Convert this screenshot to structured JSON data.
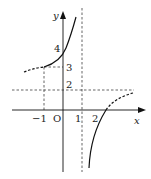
{
  "diagram": {
    "type": "function-graph",
    "axes": {
      "x_label": "x",
      "y_label": "y",
      "origin_label": "O"
    },
    "x_ticks": [
      {
        "value": -1,
        "label": "−1"
      },
      {
        "value": 1,
        "label": "1"
      },
      {
        "value": 2,
        "label": "2"
      }
    ],
    "y_ticks": [
      {
        "value": 2,
        "label": "2"
      },
      {
        "value": 3,
        "label": "3"
      },
      {
        "value": 4,
        "label": "4"
      }
    ],
    "asymptotes": [
      {
        "orientation": "vertical",
        "value": 1,
        "style": "dashed"
      },
      {
        "orientation": "horizontal",
        "value": 2,
        "style": "dashed"
      }
    ],
    "guide_lines": [
      {
        "from": [
          -1,
          0
        ],
        "to": [
          -1,
          3
        ],
        "style": "dashed"
      },
      {
        "from": [
          -1,
          3
        ],
        "to": [
          0,
          3
        ],
        "style": "dashed"
      }
    ],
    "branches": [
      {
        "name": "left-branch",
        "solid_from_x": -1,
        "dashed_left_of_x": -1,
        "passes_through": [
          [
            -1,
            3
          ],
          [
            0,
            4
          ]
        ]
      },
      {
        "name": "right-branch",
        "solid_left_of_intercept": true,
        "x_intercept_approx": 2.5,
        "dashed_right_of_intercept": true
      }
    ],
    "colors": {
      "stroke": "#111111",
      "background": "#ffffff"
    }
  }
}
